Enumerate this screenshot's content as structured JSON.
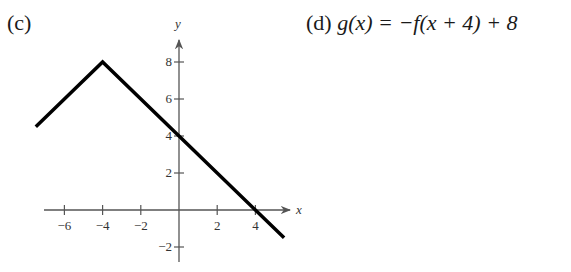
{
  "labels": {
    "part_c": "(c)",
    "part_d_prefix": "(d)",
    "part_d_formula": "g(x) = −f(x + 4) + 8"
  },
  "chart_data": {
    "type": "line",
    "title": "",
    "xlabel": "x",
    "ylabel": "y",
    "xlim": [
      -7.5,
      6
    ],
    "ylim": [
      -3,
      9.5
    ],
    "grid": false,
    "legend": null,
    "x_ticks": [
      -6,
      -4,
      -2,
      2,
      4
    ],
    "x_tick_labels": [
      "−6",
      "−4",
      "−2",
      "2",
      "4"
    ],
    "y_ticks": [
      -2,
      2,
      4,
      6,
      8
    ],
    "y_tick_labels": [
      "−2",
      "2",
      "4",
      "6",
      "8"
    ],
    "series": [
      {
        "name": "g(x)",
        "color": "#000000",
        "points": [
          [
            -7.5,
            4.5
          ],
          [
            -4,
            8
          ],
          [
            0,
            4
          ],
          [
            4,
            0
          ],
          [
            5.5,
            -1.5
          ]
        ]
      }
    ],
    "annotations": []
  },
  "colors": {
    "axis": "#555555",
    "curve": "#000000"
  }
}
